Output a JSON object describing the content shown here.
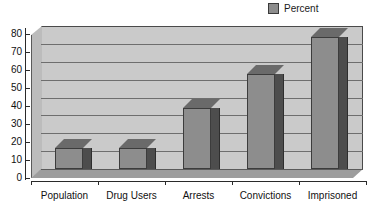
{
  "chart_data": {
    "type": "bar",
    "title": "",
    "subtitle": "",
    "xlabel": "",
    "ylabel": "",
    "categories": [
      "Population",
      "Drug Users",
      "Arrests",
      "Convictions",
      "Imprisoned"
    ],
    "values": [
      12,
      12,
      34,
      53,
      74
    ],
    "series": [
      {
        "name": "Percent",
        "values": [
          12,
          12,
          34,
          53,
          74
        ]
      }
    ],
    "ylim": [
      0,
      80
    ],
    "yticks": [
      0,
      10,
      20,
      30,
      40,
      50,
      60,
      70,
      80
    ],
    "ytick_labels": [
      "0",
      "10",
      "20",
      "30",
      "40",
      "50",
      "60",
      "70",
      "80"
    ],
    "grid": true,
    "grid_axis": "y",
    "legend": {
      "position": "top-right",
      "entries": [
        {
          "label": "Percent",
          "color": "#8d8d8d"
        }
      ]
    },
    "style": {
      "three_d": true,
      "plot_background": "#cacaca",
      "gridline_color": "#6e6e6e",
      "bar_face_color": "#8d8d8d",
      "bar_side_color": "#4d4d4d",
      "bar_top_color": "#6a6a6a",
      "axis_color": "#2a2a2a",
      "text_color": "#111111",
      "page_background": "#ffffff"
    }
  }
}
